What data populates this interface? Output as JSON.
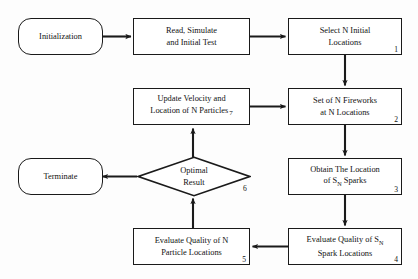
{
  "diagram": {
    "stroke_color": "#1a1a1a",
    "background_color": "#fdfdfd",
    "nodes": {
      "initialization": {
        "label": "Initialization",
        "shape": "rounded-rectangle"
      },
      "read_simulate": {
        "label": "Read, Simulate\nand Initial Test",
        "shape": "rectangle"
      },
      "select_initial": {
        "label": "Select N Initial\nLocations",
        "number": "1",
        "shape": "rectangle"
      },
      "set_fireworks": {
        "label": "Set of N Fireworks\nat N Locations",
        "number": "2",
        "shape": "rectangle"
      },
      "obtain_location": {
        "label_line1": "Obtain The Location",
        "label_line2_pre": "of S",
        "label_line2_sub": "N",
        "label_line2_post": " Sparks",
        "number": "3",
        "shape": "rectangle"
      },
      "evaluate_sparks": {
        "label_line1_pre": "Evaluate Quality of S",
        "label_line1_sub": "N",
        "label_line2": "Spark Locations",
        "number": "4",
        "shape": "rectangle"
      },
      "evaluate_particles": {
        "label": "Evaluate Quality of N\nParticle Locations",
        "number": "5",
        "shape": "rectangle"
      },
      "optimal_result": {
        "label": "Optimal\nResult",
        "number": "6",
        "shape": "diamond"
      },
      "update_velocity": {
        "label_line1": "Update Velocity and",
        "label_line2": "Location of N Particles",
        "number": "7",
        "shape": "rectangle"
      },
      "terminate": {
        "label": "Terminate",
        "shape": "rounded-rectangle"
      }
    },
    "edges": [
      {
        "from": "initialization",
        "to": "read_simulate",
        "direction": "right"
      },
      {
        "from": "read_simulate",
        "to": "select_initial",
        "direction": "right"
      },
      {
        "from": "select_initial",
        "to": "set_fireworks",
        "direction": "down"
      },
      {
        "from": "set_fireworks",
        "to": "obtain_location",
        "direction": "down"
      },
      {
        "from": "obtain_location",
        "to": "evaluate_sparks",
        "direction": "down"
      },
      {
        "from": "evaluate_sparks",
        "to": "evaluate_particles",
        "direction": "left"
      },
      {
        "from": "evaluate_particles",
        "to": "optimal_result",
        "direction": "up"
      },
      {
        "from": "optimal_result",
        "to": "terminate",
        "direction": "left"
      },
      {
        "from": "optimal_result",
        "to": "update_velocity",
        "direction": "up"
      },
      {
        "from": "update_velocity",
        "to": "set_fireworks",
        "direction": "right"
      }
    ]
  }
}
